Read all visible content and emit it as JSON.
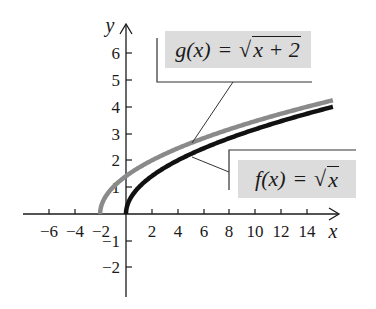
{
  "chart_data": {
    "type": "line",
    "title": "",
    "xlabel": "x",
    "ylabel": "y",
    "xlim": [
      -8,
      16
    ],
    "ylim": [
      -3,
      7
    ],
    "grid": false,
    "x_ticks": [
      -6,
      -4,
      -2,
      2,
      4,
      6,
      8,
      10,
      12,
      14
    ],
    "y_ticks": [
      -2,
      -1,
      1,
      2,
      3,
      4,
      5,
      6
    ],
    "series": [
      {
        "name": "g(x) = √(x + 2)",
        "color": "#8a8a8a",
        "domain": [
          -2,
          16
        ],
        "expression": "sqrt(x+2)"
      },
      {
        "name": "f(x) = √x",
        "color": "#111111",
        "domain": [
          0,
          16
        ],
        "expression": "sqrt(x)"
      }
    ],
    "annotations": [
      {
        "label": "g(x) = √(x + 2)",
        "position": "upper center"
      },
      {
        "label": "f(x) = √x",
        "position": "right"
      }
    ]
  },
  "labels": {
    "x_axis": "x",
    "y_axis": "y",
    "g_name": "g(x)",
    "g_eq": "=",
    "g_radicand": "x + 2",
    "f_name": "f(x)",
    "f_eq": "=",
    "f_radicand": "x",
    "radical": "√",
    "x_tick_labels": [
      "−6",
      "−4",
      "−2",
      "2",
      "4",
      "6",
      "8",
      "10",
      "12",
      "14"
    ],
    "y_tick_labels": [
      "6",
      "5",
      "4",
      "3",
      "2",
      "1",
      "−1",
      "−2"
    ]
  },
  "colors": {
    "g_curve": "#8a8a8a",
    "f_curve": "#111111",
    "label_box": "#dcdcdc",
    "axis": "#1a1a1a"
  }
}
